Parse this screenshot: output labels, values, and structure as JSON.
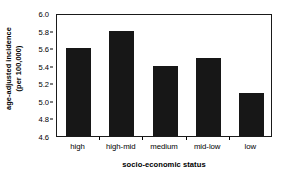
{
  "chart_data": {
    "type": "bar",
    "title": "",
    "categories": [
      "high",
      "high-mid",
      "medium",
      "mid-low",
      "low"
    ],
    "values": [
      5.6,
      5.8,
      5.4,
      5.49,
      5.09
    ],
    "xlabel": "socio-economic status",
    "ylabel": "age-adjusted incidence (per 100,000)",
    "ylabel_line1": "age-adjusted incidence",
    "ylabel_line2": "(per 100,000)",
    "ylim": [
      4.6,
      6.0
    ],
    "ytick_labels": [
      "6.0",
      "5.8",
      "5.6",
      "5.4",
      "5.2",
      "5.0",
      "4.8",
      "4.6"
    ],
    "ytick_values": [
      6.0,
      5.8,
      5.6,
      5.4,
      5.2,
      5.0,
      4.8,
      4.6
    ],
    "grid": false,
    "legend": "none",
    "bar_color": "#171717",
    "axis_color": "#1a1a1a",
    "background_color": "#ffffff"
  }
}
